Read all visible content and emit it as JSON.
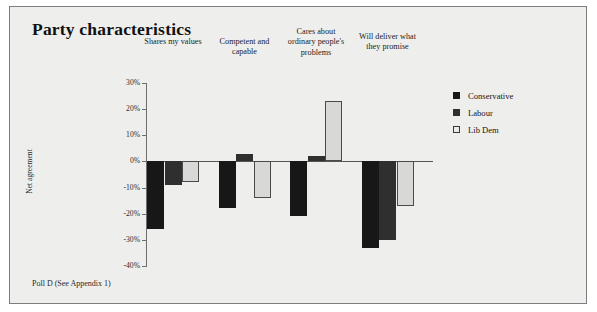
{
  "title": "Party characteristics",
  "footer": "Poll D (See Appendix 1)",
  "legend": {
    "items": [
      {
        "label": "Conservative",
        "color": "#171717",
        "key": "conservative"
      },
      {
        "label": "Labour",
        "color": "#2f2f2f",
        "key": "labour"
      },
      {
        "label": "Lib Dem",
        "color": "#d8d8d6",
        "key": "libdem"
      }
    ]
  },
  "axis": {
    "title": "Net agreement",
    "ticks": [
      "30%",
      "20%",
      "10%",
      "0%",
      "-10%",
      "-20%",
      "-30%",
      "-40%"
    ],
    "tick_values": [
      30,
      20,
      10,
      0,
      -10,
      -20,
      -30,
      -40
    ]
  },
  "chart_data": {
    "type": "bar",
    "title": "Party characteristics",
    "xlabel": "",
    "ylabel": "Net agreement",
    "ylim": [
      -40,
      30
    ],
    "grid": false,
    "legend_position": "right",
    "categories": [
      "Shares my values",
      "Competent and capable",
      "Cares about ordinary people's problems",
      "Will deliver what they promise"
    ],
    "series": [
      {
        "name": "Conservative",
        "color": "#171717",
        "values": [
          -26,
          -18,
          -21,
          -33
        ]
      },
      {
        "name": "Labour",
        "color": "#2f2f2f",
        "values": [
          -9,
          3,
          2,
          -30
        ]
      },
      {
        "name": "Lib Dem",
        "color": "#d8d8d6",
        "values": [
          -8,
          -14,
          23,
          -17
        ]
      }
    ],
    "annotations": [
      "Poll D (See Appendix 1)"
    ]
  }
}
